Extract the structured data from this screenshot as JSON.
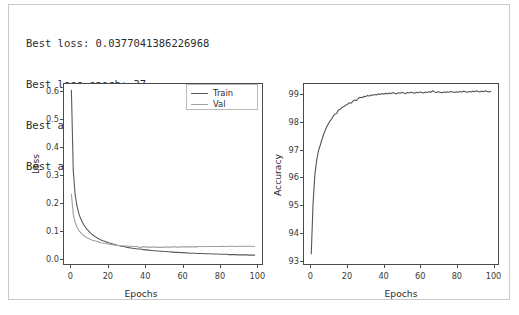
{
  "summary": {
    "lines": [
      "Best loss: 0.0377041386226968",
      "Best loss epoch: 37",
      "Best accuracy: 99.15833333333332",
      "Best accuracy epoch: 67"
    ],
    "best_loss_label": "Best loss:",
    "best_loss_value": "0.0377041386226968",
    "best_loss_epoch_label": "Best loss epoch:",
    "best_loss_epoch_value": "37",
    "best_accuracy_label": "Best accuracy:",
    "best_accuracy_value": "99.15833333333332",
    "best_accuracy_epoch_label": "Best accuracy epoch:",
    "best_accuracy_epoch_value": "67"
  },
  "colors": {
    "train": "#5a5a5a",
    "val": "#a0a0a0",
    "accuracy": "#555555",
    "axis": "#4a4a4a",
    "text": "#2b2b2b",
    "frame": "#c9c9c9",
    "background": "#ffffff"
  },
  "chart_data": [
    {
      "type": "line",
      "title": "",
      "xlabel": "Epochs",
      "ylabel": "Loss",
      "xlim": [
        -4,
        103
      ],
      "ylim": [
        -0.02,
        0.63
      ],
      "xticks": [
        0,
        20,
        40,
        60,
        80,
        100
      ],
      "xticklabels": [
        "0",
        "20",
        "40",
        "60",
        "80",
        "100"
      ],
      "yticks": [
        0.0,
        0.1,
        0.2,
        0.3,
        0.4,
        0.5,
        0.6
      ],
      "yticklabels": [
        "0.0",
        "0.1",
        "0.2",
        "0.3",
        "0.4",
        "0.5",
        "0.6"
      ],
      "grid": false,
      "legend_position": "upper right",
      "legend": [
        "Train",
        "Val"
      ],
      "x": [
        0,
        1,
        2,
        3,
        4,
        5,
        6,
        7,
        8,
        9,
        10,
        11,
        12,
        13,
        14,
        15,
        16,
        17,
        18,
        19,
        20,
        21,
        22,
        23,
        24,
        25,
        26,
        27,
        28,
        29,
        30,
        31,
        32,
        33,
        34,
        35,
        36,
        37,
        38,
        39,
        40,
        41,
        42,
        43,
        44,
        45,
        46,
        47,
        48,
        49,
        50,
        51,
        52,
        53,
        54,
        55,
        56,
        57,
        58,
        59,
        60,
        61,
        62,
        63,
        64,
        65,
        66,
        67,
        68,
        69,
        70,
        71,
        72,
        73,
        74,
        75,
        76,
        77,
        78,
        79,
        80,
        81,
        82,
        83,
        84,
        85,
        86,
        87,
        88,
        89,
        90,
        91,
        92,
        93,
        94,
        95,
        96,
        97,
        98,
        99
      ],
      "series": [
        {
          "name": "Train",
          "values": [
            0.607,
            0.318,
            0.232,
            0.19,
            0.163,
            0.144,
            0.13,
            0.118,
            0.109,
            0.101,
            0.094,
            0.088,
            0.083,
            0.078,
            0.074,
            0.07,
            0.067,
            0.064,
            0.062,
            0.059,
            0.057,
            0.055,
            0.053,
            0.051,
            0.049,
            0.047,
            0.046,
            0.044,
            0.043,
            0.042,
            0.04,
            0.039,
            0.038,
            0.037,
            0.036,
            0.035,
            0.034,
            0.034,
            0.033,
            0.032,
            0.031,
            0.031,
            0.03,
            0.029,
            0.029,
            0.028,
            0.027,
            0.027,
            0.026,
            0.026,
            0.025,
            0.025,
            0.024,
            0.024,
            0.023,
            0.023,
            0.022,
            0.022,
            0.022,
            0.021,
            0.021,
            0.021,
            0.02,
            0.02,
            0.019,
            0.019,
            0.019,
            0.019,
            0.018,
            0.018,
            0.018,
            0.018,
            0.017,
            0.017,
            0.017,
            0.017,
            0.016,
            0.016,
            0.016,
            0.016,
            0.015,
            0.015,
            0.015,
            0.015,
            0.015,
            0.014,
            0.014,
            0.014,
            0.014,
            0.014,
            0.013,
            0.013,
            0.013,
            0.013,
            0.013,
            0.013,
            0.012,
            0.012,
            0.012,
            0.012
          ]
        },
        {
          "name": "Val",
          "values": [
            0.232,
            0.16,
            0.13,
            0.113,
            0.101,
            0.093,
            0.086,
            0.081,
            0.077,
            0.073,
            0.07,
            0.067,
            0.065,
            0.063,
            0.061,
            0.059,
            0.057,
            0.056,
            0.055,
            0.053,
            0.052,
            0.051,
            0.05,
            0.049,
            0.048,
            0.047,
            0.047,
            0.046,
            0.046,
            0.045,
            0.045,
            0.044,
            0.044,
            0.043,
            0.043,
            0.043,
            0.042,
            0.0377,
            0.042,
            0.042,
            0.042,
            0.041,
            0.041,
            0.041,
            0.041,
            0.041,
            0.041,
            0.04,
            0.04,
            0.04,
            0.041,
            0.041,
            0.041,
            0.041,
            0.041,
            0.042,
            0.042,
            0.041,
            0.041,
            0.042,
            0.042,
            0.042,
            0.042,
            0.042,
            0.042,
            0.042,
            0.042,
            0.042,
            0.042,
            0.043,
            0.043,
            0.043,
            0.042,
            0.043,
            0.043,
            0.043,
            0.043,
            0.043,
            0.043,
            0.043,
            0.043,
            0.043,
            0.044,
            0.043,
            0.043,
            0.043,
            0.044,
            0.044,
            0.043,
            0.043,
            0.044,
            0.044,
            0.044,
            0.044,
            0.043,
            0.044,
            0.044,
            0.044,
            0.043,
            0.044
          ]
        }
      ]
    },
    {
      "type": "line",
      "title": "",
      "xlabel": "Epochs",
      "ylabel": "Accuracy",
      "xlim": [
        -4,
        103
      ],
      "ylim": [
        92.85,
        99.4
      ],
      "xticks": [
        0,
        20,
        40,
        60,
        80,
        100
      ],
      "xticklabels": [
        "0",
        "20",
        "40",
        "60",
        "80",
        "100"
      ],
      "yticks": [
        93,
        94,
        95,
        96,
        97,
        98,
        99
      ],
      "yticklabels": [
        "93",
        "94",
        "95",
        "96",
        "97",
        "98",
        "99"
      ],
      "grid": false,
      "legend_position": "none",
      "legend": [],
      "x": [
        0,
        1,
        2,
        3,
        4,
        5,
        6,
        7,
        8,
        9,
        10,
        11,
        12,
        13,
        14,
        15,
        16,
        17,
        18,
        19,
        20,
        21,
        22,
        23,
        24,
        25,
        26,
        27,
        28,
        29,
        30,
        31,
        32,
        33,
        34,
        35,
        36,
        37,
        38,
        39,
        40,
        41,
        42,
        43,
        44,
        45,
        46,
        47,
        48,
        49,
        50,
        51,
        52,
        53,
        54,
        55,
        56,
        57,
        58,
        59,
        60,
        61,
        62,
        63,
        64,
        65,
        66,
        67,
        68,
        69,
        70,
        71,
        72,
        73,
        74,
        75,
        76,
        77,
        78,
        79,
        80,
        81,
        82,
        83,
        84,
        85,
        86,
        87,
        88,
        89,
        90,
        91,
        92,
        93,
        94,
        95,
        96,
        97,
        98,
        99
      ],
      "series": [
        {
          "name": "Accuracy",
          "values": [
            93.22,
            95.05,
            96.1,
            96.62,
            96.98,
            97.18,
            97.4,
            97.6,
            97.76,
            97.9,
            98.02,
            98.1,
            98.22,
            98.3,
            98.33,
            98.45,
            98.48,
            98.55,
            98.58,
            98.63,
            98.66,
            98.72,
            98.7,
            98.78,
            98.82,
            98.8,
            98.88,
            98.92,
            98.9,
            98.95,
            98.94,
            98.98,
            98.96,
            99.0,
            98.99,
            99.02,
            99.0,
            99.04,
            99.02,
            99.05,
            99.03,
            99.06,
            99.04,
            99.07,
            99.05,
            99.09,
            99.06,
            99.04,
            99.08,
            99.06,
            99.1,
            99.07,
            99.05,
            99.09,
            99.07,
            99.1,
            99.08,
            99.06,
            99.1,
            99.08,
            99.11,
            99.09,
            99.07,
            99.11,
            99.09,
            99.12,
            99.1,
            99.158,
            99.11,
            99.09,
            99.12,
            99.1,
            99.08,
            99.11,
            99.09,
            99.12,
            99.1,
            99.13,
            99.11,
            99.09,
            99.12,
            99.1,
            99.13,
            99.11,
            99.14,
            99.12,
            99.1,
            99.13,
            99.11,
            99.14,
            99.12,
            99.15,
            99.13,
            99.11,
            99.14,
            99.12,
            99.15,
            99.13,
            99.11,
            99.14
          ]
        }
      ]
    }
  ]
}
